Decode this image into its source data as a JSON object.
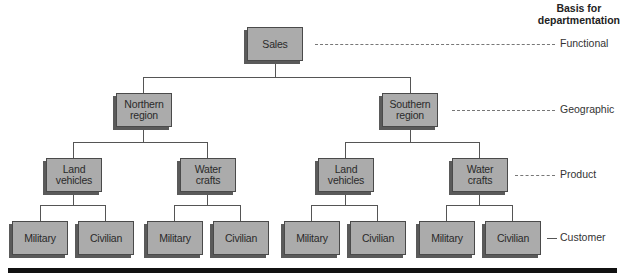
{
  "heading": {
    "line1": "Basis for",
    "line2": "departmentation"
  },
  "levels": [
    {
      "label": "Functional"
    },
    {
      "label": "Geographic"
    },
    {
      "label": "Product"
    },
    {
      "label": "Customer"
    }
  ],
  "tree": {
    "root": "Sales",
    "regions": [
      {
        "line1": "Northern",
        "line2": "region"
      },
      {
        "line1": "Southern",
        "line2": "region"
      }
    ],
    "products": [
      {
        "line1": "Land",
        "line2": "vehicles"
      },
      {
        "line1": "Water",
        "line2": "crafts"
      },
      {
        "line1": "Land",
        "line2": "vehicles"
      },
      {
        "line1": "Water",
        "line2": "crafts"
      }
    ],
    "customers": [
      "Military",
      "Civilian",
      "Military",
      "Civilian",
      "Military",
      "Civilian",
      "Military",
      "Civilian"
    ]
  },
  "colors": {
    "box_fill": "#ababab",
    "box_shadow": "#5a5a5a",
    "bar": "#111111"
  }
}
